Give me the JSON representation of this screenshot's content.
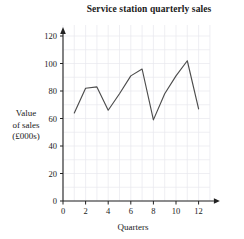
{
  "chart_data": {
    "type": "line",
    "title": "Service station quarterly sales",
    "xlabel": "Quarters",
    "ylabel": "Value of sales (£000s)",
    "ylabel_lines": [
      "Value",
      "of sales",
      "(£000s)"
    ],
    "x": [
      1,
      2,
      3,
      4,
      5,
      6,
      7,
      8,
      9,
      10,
      11,
      12
    ],
    "values": [
      64,
      82,
      83,
      66,
      78,
      91,
      96,
      59,
      78,
      91,
      102,
      67
    ],
    "categories": [
      "1",
      "2",
      "3",
      "4",
      "5",
      "6",
      "7",
      "8",
      "9",
      "10",
      "11",
      "12"
    ],
    "xlim": [
      0,
      13
    ],
    "ylim": [
      0,
      128
    ],
    "x_ticks": [
      0,
      2,
      4,
      6,
      8,
      10,
      12
    ],
    "x_tick_labels": [
      "0",
      "2",
      "4",
      "6",
      "8",
      "10",
      "12"
    ],
    "y_ticks": [
      0,
      20,
      40,
      60,
      80,
      100,
      120
    ],
    "y_tick_labels": [
      "0",
      "20",
      "40",
      "60",
      "80",
      "100",
      "120"
    ],
    "grid": true,
    "legend": null,
    "line_color": "#4d4d4d",
    "grid_color": "#e8e8ee",
    "axis_color": "#222222",
    "markers": false
  }
}
